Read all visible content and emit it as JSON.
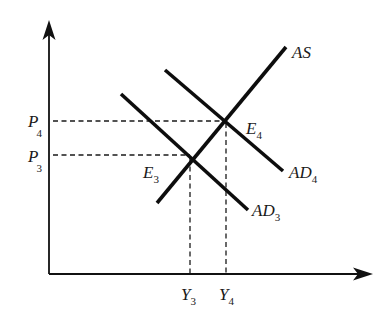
{
  "diagram": {
    "type": "AS-AD model",
    "axes": {
      "y_axis": {
        "label": ""
      },
      "x_axis": {
        "label": ""
      }
    },
    "curves": [
      {
        "id": "AS",
        "label": "AS",
        "sub": ""
      },
      {
        "id": "AD3",
        "label": "AD",
        "sub": "3"
      },
      {
        "id": "AD4",
        "label": "AD",
        "sub": "4"
      }
    ],
    "equilibria": [
      {
        "id": "E3",
        "label": "E",
        "sub": "3",
        "price": "P3",
        "output": "Y3"
      },
      {
        "id": "E4",
        "label": "E",
        "sub": "4",
        "price": "P4",
        "output": "Y4"
      }
    ],
    "price_ticks": [
      {
        "label": "P",
        "sub": "4"
      },
      {
        "label": "P",
        "sub": "3"
      }
    ],
    "output_ticks": [
      {
        "label": "Y",
        "sub": "3"
      },
      {
        "label": "Y",
        "sub": "4"
      }
    ],
    "colors": {
      "line": "#0d0d0d",
      "background": "#ffffff"
    }
  }
}
